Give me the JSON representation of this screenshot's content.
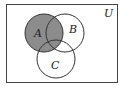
{
  "diagram": {
    "type": "venn",
    "universe_label": "U",
    "sets": [
      {
        "id": "A",
        "label": "A",
        "cx": 44,
        "cy": 33,
        "r": 19,
        "shaded": true
      },
      {
        "id": "B",
        "label": "B",
        "cx": 65,
        "cy": 33,
        "r": 19,
        "shaded": false
      },
      {
        "id": "C",
        "label": "C",
        "cx": 56,
        "cy": 59,
        "r": 19,
        "shaded": false
      }
    ],
    "shaded_region": "A",
    "colors": {
      "shade": "#8c8c8c",
      "stroke": "#333333",
      "background": "#ffffff"
    }
  }
}
